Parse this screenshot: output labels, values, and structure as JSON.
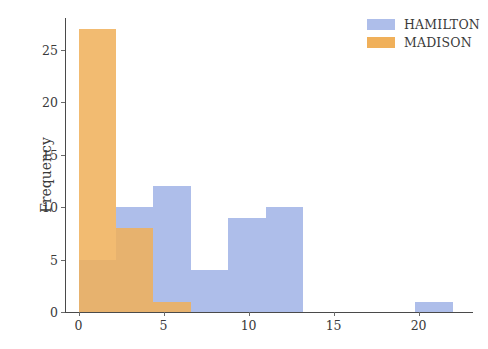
{
  "chart_data": {
    "type": "bar",
    "title": "",
    "subtitle": "",
    "xlabel": "",
    "ylabel": "Frequency",
    "xlim": [
      -0.8,
      23.2
    ],
    "ylim": [
      0,
      28
    ],
    "grid": false,
    "legend_position": "top-right",
    "xticks": [
      0,
      5,
      10,
      15,
      20
    ],
    "xtick_labels": [
      "0",
      "5",
      "10",
      "15",
      "20"
    ],
    "yticks": [
      0,
      5,
      10,
      15,
      20,
      25
    ],
    "ytick_labels": [
      "0",
      "5",
      "10",
      "15",
      "20",
      "25"
    ],
    "colors": {
      "hamilton": "#aebeea",
      "madison": "#f0b05a",
      "overlap": "#cfa260",
      "axis": "#4a4a4a",
      "text": "#3a3a3a",
      "background": "#ffffff"
    },
    "series": [
      {
        "name": "HAMILTON",
        "color": "#aebeea",
        "bins": [
          {
            "x0": 0,
            "x1": 2.2,
            "value": 5
          },
          {
            "x0": 2.2,
            "x1": 4.4,
            "value": 10
          },
          {
            "x0": 4.4,
            "x1": 6.6,
            "value": 12
          },
          {
            "x0": 6.6,
            "x1": 8.8,
            "value": 4
          },
          {
            "x0": 8.8,
            "x1": 11.0,
            "value": 9
          },
          {
            "x0": 11.0,
            "x1": 13.2,
            "value": 10
          },
          {
            "x0": 19.8,
            "x1": 22.0,
            "value": 1
          }
        ]
      },
      {
        "name": "MADISON",
        "color": "#f0b05a",
        "bins": [
          {
            "x0": 0,
            "x1": 2.2,
            "value": 27
          },
          {
            "x0": 2.2,
            "x1": 4.4,
            "value": 8
          },
          {
            "x0": 4.4,
            "x1": 6.6,
            "value": 1
          }
        ]
      }
    ]
  },
  "legend": {
    "items": [
      {
        "label": "HAMILTON",
        "color": "#aebeea"
      },
      {
        "label": "MADISON",
        "color": "#f0b05a"
      }
    ]
  },
  "axes": {
    "y_title": "Frequency",
    "x_title": ""
  }
}
